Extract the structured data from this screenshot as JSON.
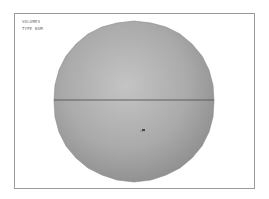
{
  "viewport": {
    "labels": [
      "VOLUMES",
      "TYPE NUM"
    ]
  },
  "model": {
    "shape": "sphere",
    "fill_color": "#a8a8a8",
    "edge_color": "#555555",
    "equator_line": true
  }
}
